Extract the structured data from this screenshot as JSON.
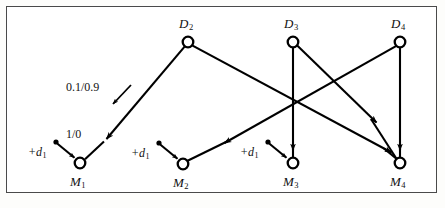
{
  "figure": {
    "kind": "signal-flow-diagram",
    "border_color": "#4a4a4a",
    "stroke_color": "#000000",
    "background": "#ffffff",
    "width": 445,
    "height": 208
  },
  "nodes": {
    "drivers": [
      {
        "id": "D2",
        "label": "D",
        "sub": "2",
        "cx": 188,
        "cy": 42,
        "r": 5.5,
        "label_x": 179,
        "label_y": 17
      },
      {
        "id": "D3",
        "label": "D",
        "sub": "3",
        "cx": 293,
        "cy": 42,
        "r": 5.5,
        "label_x": 284,
        "label_y": 17
      },
      {
        "id": "D4",
        "label": "D",
        "sub": "4",
        "cx": 400,
        "cy": 42,
        "r": 5.5,
        "label_x": 391,
        "label_y": 17
      }
    ],
    "machines": [
      {
        "id": "M1",
        "label": "M",
        "sub": "1",
        "cx": 80,
        "cy": 163,
        "r": 5.5,
        "label_x": 70,
        "label_y": 175
      },
      {
        "id": "M2",
        "label": "M",
        "sub": "2",
        "cx": 183,
        "cy": 164,
        "r": 5.5,
        "label_x": 173,
        "label_y": 176
      },
      {
        "id": "M3",
        "label": "M",
        "sub": "3",
        "cx": 293,
        "cy": 163,
        "r": 5.5,
        "label_x": 283,
        "label_y": 175
      },
      {
        "id": "M4",
        "label": "M",
        "sub": "4",
        "cx": 400,
        "cy": 163,
        "r": 5.5,
        "label_x": 390,
        "label_y": 175
      }
    ]
  },
  "inputs": [
    {
      "id": "in-M1",
      "label": "+d",
      "sub": "1",
      "dot_x": 56,
      "dot_y": 142,
      "target": "M1",
      "label_x": 28,
      "label_y": 146
    },
    {
      "id": "in-M2",
      "label": "+d",
      "sub": "1",
      "dot_x": 159,
      "dot_y": 143,
      "target": "M2",
      "label_x": 131,
      "label_y": 147
    },
    {
      "id": "in-M3",
      "label": "+d",
      "sub": "1",
      "dot_x": 268,
      "dot_y": 142,
      "target": "M3",
      "label_x": 240,
      "label_y": 146
    }
  ],
  "edges": [
    {
      "id": "D2-M1",
      "from": "D2",
      "to": "M1",
      "weight_label": "1/0"
    },
    {
      "id": "D2-M4",
      "from": "D2",
      "to": "M4",
      "weight_label": ""
    },
    {
      "id": "D3-M3",
      "from": "D3",
      "to": "M3",
      "weight_label": ""
    },
    {
      "id": "D3-M4",
      "from": "D3",
      "to": "M4",
      "weight_label": ""
    },
    {
      "id": "D4-M2",
      "from": "D4",
      "to": "M2",
      "weight_label": ""
    },
    {
      "id": "D4-M4",
      "from": "D4",
      "to": "M4",
      "weight_label": ""
    }
  ],
  "edge_labels": {
    "probability": {
      "text": "0.1/0.9",
      "x": 66,
      "y": 81
    },
    "cost": {
      "text": "1/0",
      "x": 66,
      "y": 128
    }
  },
  "annotation_pointer": {
    "id": "prob-pointer",
    "from_x": 131,
    "from_y": 85,
    "to_x": 113,
    "to_y": 104
  }
}
